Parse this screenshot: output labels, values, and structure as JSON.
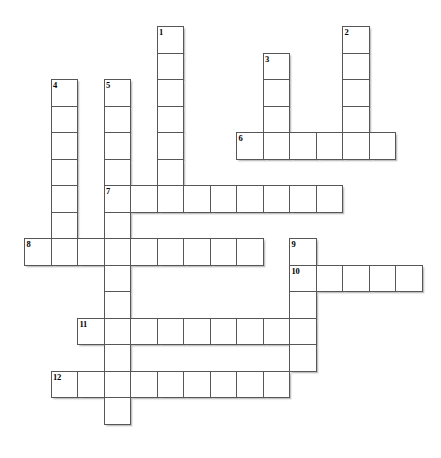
{
  "puzzle": {
    "type": "crossword-grid",
    "title": "Blank crossword puzzle grid",
    "cell_size": 26.5,
    "origin": {
      "x": 24,
      "y": 26
    },
    "grid_columns": 15,
    "grid_rows": 16,
    "ink_color": "#575757",
    "cell_fill": "#ffffff",
    "number_color": "#000000",
    "entries": [
      {
        "number": "1",
        "direction": "down",
        "col": 5,
        "row": 0,
        "length": 7
      },
      {
        "number": "2",
        "direction": "down",
        "col": 12,
        "row": 0,
        "length": 5
      },
      {
        "number": "3",
        "direction": "down",
        "col": 9,
        "row": 1,
        "length": 4
      },
      {
        "number": "4",
        "direction": "down",
        "col": 1,
        "row": 2,
        "length": 7
      },
      {
        "number": "5",
        "direction": "down",
        "col": 3,
        "row": 2,
        "length": 13
      },
      {
        "number": "6",
        "direction": "across",
        "col": 8,
        "row": 4,
        "length": 6
      },
      {
        "number": "7",
        "direction": "across",
        "col": 3,
        "row": 6,
        "length": 9
      },
      {
        "number": "8",
        "direction": "across",
        "col": 0,
        "row": 8,
        "length": 9
      },
      {
        "number": "9",
        "direction": "down",
        "col": 10,
        "row": 8,
        "length": 5
      },
      {
        "number": "10",
        "direction": "across",
        "col": 10,
        "row": 9,
        "length": 5
      },
      {
        "number": "11",
        "direction": "across",
        "col": 2,
        "row": 11,
        "length": 9
      },
      {
        "number": "12",
        "direction": "across",
        "col": 1,
        "row": 13,
        "length": 9
      }
    ],
    "numbers": [
      "1",
      "2",
      "3",
      "4",
      "5",
      "6",
      "7",
      "8",
      "9",
      "10",
      "11",
      "12"
    ]
  }
}
